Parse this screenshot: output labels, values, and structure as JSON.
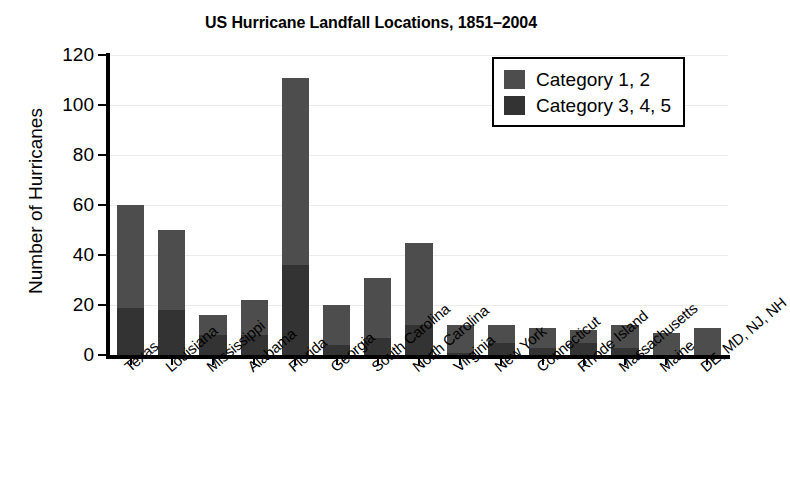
{
  "chart_data": {
    "type": "bar",
    "subtype": "stacked",
    "title": "US Hurricane Landfall Locations, 1851–2004",
    "xlabel": "",
    "ylabel": "Number of Hurricanes",
    "ylim": [
      0,
      120
    ],
    "yticks": [
      0,
      20,
      40,
      60,
      80,
      100,
      120
    ],
    "grid": true,
    "legend_position": "top-right",
    "categories": [
      "Texas",
      "Louisiana",
      "Mississippi",
      "Alabama",
      "Florida",
      "Georgia",
      "South Carolina",
      "North Carolina",
      "Virginia",
      "New York",
      "Connecticut",
      "Rhode Island",
      "Massachusetts",
      "Maine",
      "DE, MD, NJ, NH"
    ],
    "series": [
      {
        "name": "Category 3, 4, 5",
        "color": "#333333",
        "values": [
          19,
          18,
          8,
          8,
          36,
          4,
          7,
          12,
          1,
          5,
          3,
          5,
          3,
          0,
          0
        ]
      },
      {
        "name": "Category 1, 2",
        "color": "#4d4d4d",
        "values": [
          41,
          32,
          8,
          14,
          75,
          16,
          24,
          33,
          11,
          7,
          8,
          5,
          9,
          9,
          11
        ]
      }
    ],
    "totals": [
      60,
      50,
      16,
      22,
      111,
      20,
      31,
      45,
      12,
      12,
      11,
      10,
      12,
      9,
      11
    ]
  },
  "legend": {
    "entries": [
      {
        "label": "Category 1, 2",
        "color": "#4d4d4d"
      },
      {
        "label": "Category 3, 4, 5",
        "color": "#333333"
      }
    ]
  }
}
